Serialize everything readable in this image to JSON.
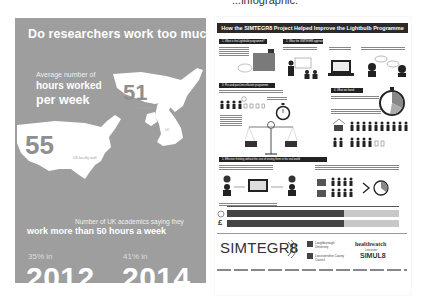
{
  "caption": "...infographic.",
  "left_panel": {
    "title": "Do researchers work too much?",
    "avg_label": "Average number of",
    "hours_label": "hours worked",
    "per_week_label": "per week",
    "uk_value": "51",
    "uk_label": "UK academics",
    "us_value": "55",
    "us_label": "US faculty staff",
    "uk_region_label": "UK",
    "count_label": "Number of UK academics saying they",
    "headline": "work more than 50 hours a week",
    "stat_2012_pct": "35% in",
    "stat_2012_year": "2012",
    "stat_2014_pct": "41% in",
    "stat_2014_year": "2014",
    "colors": {
      "background": "#9e9e9e",
      "text": "#ffffff",
      "number": "#8f8f8f"
    }
  },
  "right_panel": {
    "title": "How the SIMTEGR8 Project Helped Improve the Lightbulb Programme",
    "sections": [
      {
        "label": "1. What is the Lightbulb programme?"
      },
      {
        "label": "2. What the SIMTEGR8 approach"
      },
      {
        "label": "3. Pre-and post-line efficient programme"
      },
      {
        "label": "4. What we found"
      },
      {
        "label": "5. Effective thinking without the cost of testing them in the real world"
      }
    ],
    "bars": [
      {
        "icon": "clock",
        "dark_pct": 0.68,
        "light_pct": 0.32
      },
      {
        "icon": "£",
        "dark_pct": 0.68,
        "light_pct": 0.32
      }
    ],
    "logos": {
      "simtegr8_prefix": "SIMTEGR",
      "simtegr8_suffix": "8",
      "loughborough": "Loughborough University",
      "leicestershire": "Leicestershire County Council",
      "healthwatch": "healthwatch",
      "healthwatch_sub": "Leicester",
      "simul8": "SIMUL8"
    },
    "colors": {
      "banner": "#2a2a2a",
      "bar_dark": "#444444",
      "bar_light": "#c8c8c8"
    }
  }
}
